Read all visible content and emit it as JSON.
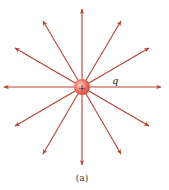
{
  "diagram": {
    "charge": {
      "symbol": "+",
      "label": "q",
      "center": [
        82,
        87
      ],
      "radius": 8
    },
    "caption": "(a)",
    "line_color": "#b5402f",
    "charge_fill": "#e8635a",
    "field_lines": [
      {
        "x": 82,
        "y": 9
      },
      {
        "x": 121,
        "y": 21
      },
      {
        "x": 149,
        "y": 48
      },
      {
        "x": 161,
        "y": 87
      },
      {
        "x": 149,
        "y": 126
      },
      {
        "x": 121,
        "y": 154
      },
      {
        "x": 82,
        "y": 165
      },
      {
        "x": 43,
        "y": 154
      },
      {
        "x": 15,
        "y": 126
      },
      {
        "x": 4,
        "y": 87
      },
      {
        "x": 15,
        "y": 48
      },
      {
        "x": 43,
        "y": 21
      }
    ]
  }
}
